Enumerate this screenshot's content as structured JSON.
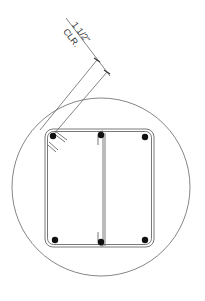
{
  "diagram": {
    "type": "rebar-cross-section-detail",
    "dimension": {
      "value": "1 1/2\"",
      "note": "CLR."
    },
    "colors": {
      "line": "#555555",
      "rebar": "#111111",
      "background": "#ffffff"
    },
    "elements": {
      "detail_circle": "circle",
      "tie": "rectangular stirrup with rounded corners",
      "cross_tie": "vertical cross tie at center",
      "longitudinal_bars": 6
    }
  }
}
